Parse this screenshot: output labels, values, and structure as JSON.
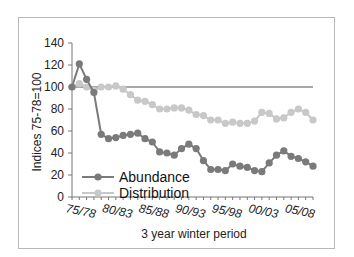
{
  "chart_data": {
    "type": "line",
    "title": "",
    "xlabel": "3 year winter period",
    "ylabel": "Indices 75-78=100",
    "ylim": [
      0,
      140
    ],
    "yticks": [
      0,
      20,
      40,
      60,
      80,
      100,
      120,
      140
    ],
    "xtick_labels": [
      "75/78",
      "80/83",
      "85/88",
      "90/93",
      "95/98",
      "00/03",
      "05/08"
    ],
    "grid": false,
    "legend_position": "lower-left inside plot",
    "reference_line": {
      "y": 100,
      "color": "#8a8a8a"
    },
    "series": [
      {
        "name": "Abundance",
        "color": "#7a7a7a",
        "values": [
          100,
          121,
          107,
          95,
          57,
          53,
          54,
          56,
          57,
          58,
          53,
          50,
          41,
          40,
          38,
          44,
          48,
          44,
          33,
          25,
          25,
          24,
          30,
          28,
          27,
          24,
          23,
          31,
          38,
          42,
          37,
          35,
          32,
          28
        ]
      },
      {
        "name": "Distribution",
        "color": "#c8c8c8",
        "values": [
          100,
          103,
          100,
          97,
          100,
          100,
          101,
          98,
          93,
          88,
          87,
          84,
          80,
          80,
          81,
          81,
          79,
          75,
          74,
          70,
          70,
          67,
          68,
          67,
          67,
          69,
          77,
          76,
          71,
          72,
          77,
          80,
          77,
          70
        ]
      }
    ]
  },
  "labels": {
    "ylabel": "Indices 75-78=100",
    "xlabel": "3 year winter period",
    "legend_abundance": "Abundance",
    "legend_distribution": "Distribution"
  }
}
